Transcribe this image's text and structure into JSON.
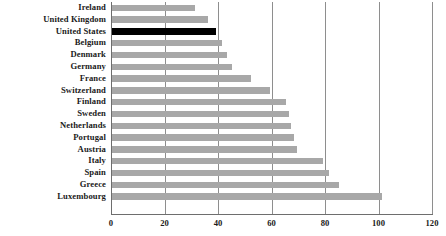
{
  "chart_data": {
    "type": "bar",
    "orientation": "horizontal",
    "title": "",
    "xlabel": "",
    "ylabel": "",
    "xlim": [
      0,
      120
    ],
    "xticks": [
      0,
      20,
      40,
      60,
      80,
      100,
      120
    ],
    "grid": true,
    "legend": "none",
    "highlight_category": "United States",
    "colors": {
      "bar": "#a8a8a8",
      "highlight_bar": "#000000",
      "axis": "#6e6e6e",
      "gridline": "#8e8e8e",
      "background": "#ffffff",
      "text": "#1a1a1a"
    },
    "categories": [
      "Ireland",
      "United Kingdom",
      "United States",
      "Belgium",
      "Denmark",
      "Germany",
      "France",
      "Switzerland",
      "Finland",
      "Sweden",
      "Netherlands",
      "Portugal",
      "Austria",
      "Italy",
      "Spain",
      "Greece",
      "Luxembourg"
    ],
    "values": [
      31,
      36,
      39,
      41,
      43,
      45,
      52,
      59,
      65,
      66,
      67,
      68,
      69,
      79,
      81,
      85,
      101
    ]
  }
}
